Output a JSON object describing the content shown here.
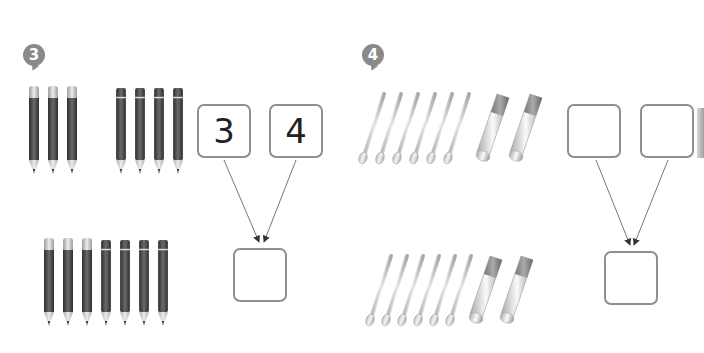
{
  "exercises": [
    {
      "number": "3",
      "group_top": {
        "pencils_with_eraser": 3,
        "pencils_without_eraser": 4
      },
      "group_bottom": {
        "pencils_with_eraser": 3,
        "pencils_without_eraser": 4
      },
      "boxes": {
        "left": "3",
        "right": "4",
        "sum": ""
      }
    },
    {
      "number": "4",
      "group_top": {
        "cotton_swabs": 6,
        "tubes": 2
      },
      "group_bottom": {
        "cotton_swabs": 6,
        "tubes": 2
      },
      "boxes": {
        "left": "",
        "right": "",
        "sum": ""
      }
    }
  ],
  "colors": {
    "badge": "#8a8a8a",
    "box_border": "#8f8f8f",
    "arrow": "#666666"
  }
}
